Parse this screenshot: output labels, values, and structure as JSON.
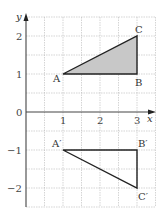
{
  "diagram": {
    "type": "coordinate-grid-reflection",
    "axes": {
      "x_label": "x",
      "y_label": "y",
      "origin_label": "0",
      "x_ticks": [
        "1",
        "2",
        "3"
      ],
      "y_ticks": [
        "2",
        "1",
        "−1",
        "−2"
      ],
      "x_range": [
        0,
        3.5
      ],
      "y_range": [
        -2.5,
        2.5
      ]
    },
    "original_triangle": {
      "fill": "#c8c8c8",
      "vertices": [
        {
          "label": "A",
          "x": 1,
          "y": 1
        },
        {
          "label": "B",
          "x": 3,
          "y": 1
        },
        {
          "label": "C",
          "x": 3,
          "y": 2
        }
      ]
    },
    "image_triangle": {
      "fill": "none",
      "vertices": [
        {
          "label": "A′",
          "x": 1,
          "y": -1
        },
        {
          "label": "B′",
          "x": 3,
          "y": -1
        },
        {
          "label": "C′",
          "x": 3,
          "y": -2
        }
      ]
    }
  }
}
